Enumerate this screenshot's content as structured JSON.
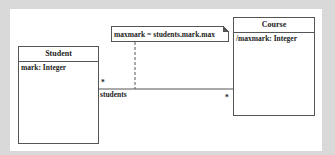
{
  "diagram": {
    "type": "UML class diagram",
    "classes": [
      {
        "name": "Student",
        "attributes": [
          "mark: Integer"
        ]
      },
      {
        "name": "Course",
        "attributes": [
          "/maxmark: Integer"
        ]
      }
    ],
    "note": {
      "text": "maxmark = students.mark.max",
      "attached_to": "association"
    },
    "association": {
      "from": "Student",
      "to": "Course",
      "student_end": {
        "multiplicity": "*",
        "role": "students"
      },
      "course_end": {
        "multiplicity": "*"
      }
    }
  },
  "colors": {
    "background": "#d9d9d9",
    "panel": "#ffffff",
    "line": "#555555"
  }
}
